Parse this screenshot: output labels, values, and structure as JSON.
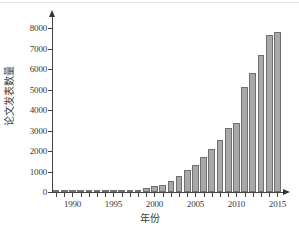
{
  "chart_data": {
    "type": "bar",
    "title": "",
    "xlabel": "年份",
    "ylabel": "论文发表数量",
    "xlim": [
      1987.5,
      2015.8
    ],
    "ylim": [
      0,
      8600
    ],
    "grid": false,
    "legend": null,
    "ytick_labels": [
      "0",
      "1000",
      "2000",
      "3000",
      "4000",
      "5000",
      "6000",
      "7000",
      "8000"
    ],
    "ytick_values": [
      0,
      1000,
      2000,
      3000,
      4000,
      5000,
      6000,
      7000,
      8000
    ],
    "xtick_labels": [
      "1990",
      "1995",
      "2000",
      "2005",
      "2010",
      "2015"
    ],
    "xtick_values": [
      1990,
      1995,
      2000,
      2005,
      2010,
      2015
    ],
    "categories": [
      1988,
      1989,
      1990,
      1991,
      1992,
      1993,
      1994,
      1995,
      1996,
      1997,
      1998,
      1999,
      2000,
      2001,
      2002,
      2003,
      2004,
      2005,
      2006,
      2007,
      2008,
      2009,
      2010,
      2011,
      2012,
      2013,
      2014,
      2015
    ],
    "values": [
      10,
      15,
      15,
      20,
      20,
      25,
      25,
      30,
      35,
      40,
      50,
      180,
      270,
      350,
      560,
      790,
      1080,
      1340,
      1690,
      2090,
      2530,
      3140,
      3370,
      5120,
      5820,
      6680,
      7680,
      7840
    ],
    "bar_color": "#a9a9a9",
    "bar_edge_color": "#6f6f6f"
  }
}
